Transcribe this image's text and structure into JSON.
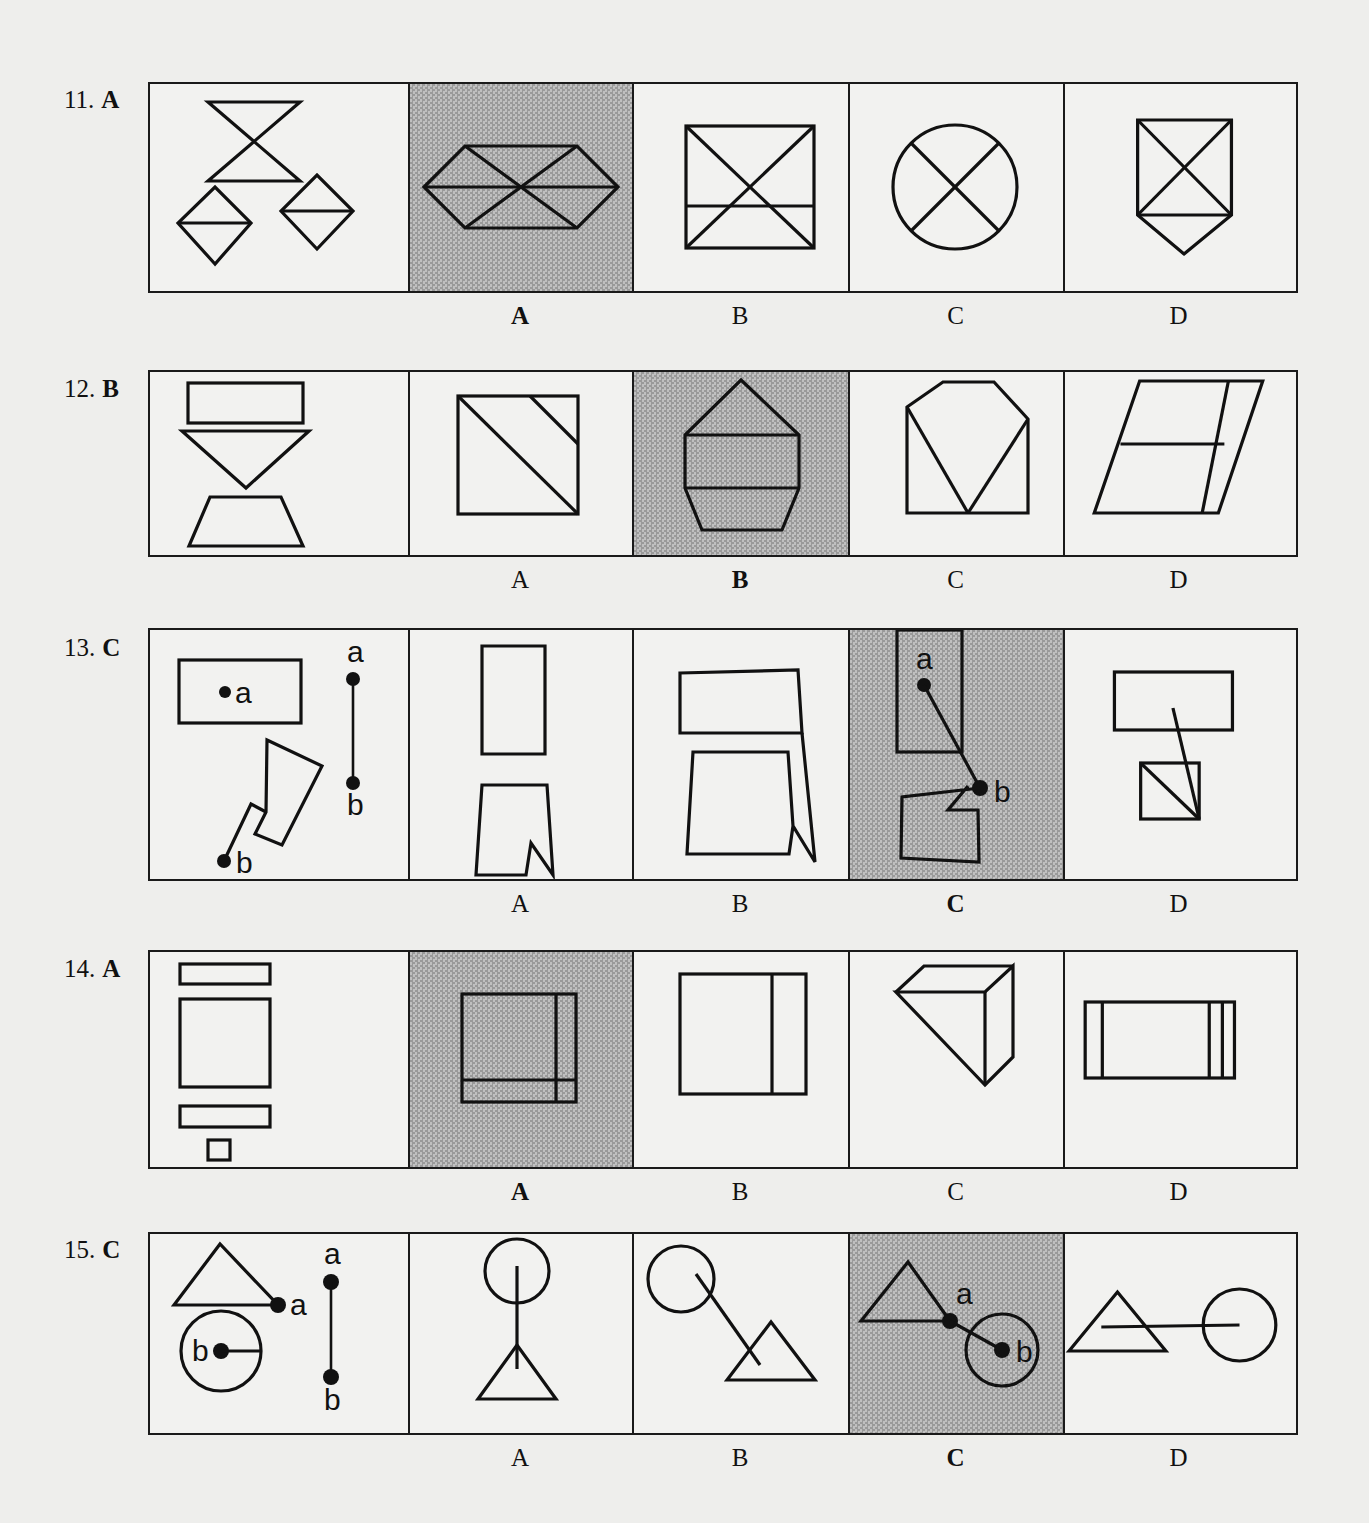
{
  "page": {
    "kind": "multiple-choice-figure-test",
    "background_color": "#eeeeec",
    "ink_color": "#111111",
    "shaded_cell_color": "#a8a8a8",
    "panel_border_color": "#1a1a1a"
  },
  "option_letters": [
    "A",
    "B",
    "C",
    "D"
  ],
  "questions": [
    {
      "number": "11.",
      "answer": "A",
      "correct_index": 0,
      "prompt_description": "bow-tie (two triangles meeting at a point), a diamond with horizontal mid-line, and a second diamond with horizontal mid-line",
      "options": [
        {
          "letter": "A",
          "shaded": true,
          "description": "elongated hexagon divided into six triangles by two diagonals and a horizontal line"
        },
        {
          "letter": "B",
          "shaded": false,
          "description": "square with both diagonals and a horizontal line across the lower third"
        },
        {
          "letter": "C",
          "shaded": false,
          "description": "circle quartered by two crossing diagonals"
        },
        {
          "letter": "D",
          "shaded": false,
          "description": "square with both diagonals plus a downward triangular point below"
        }
      ]
    },
    {
      "number": "12.",
      "answer": "B",
      "correct_index": 1,
      "prompt_description": "a horizontal rectangle, a downward-pointing triangle, and an upward trapezoid stacked vertically",
      "options": [
        {
          "letter": "A",
          "shaded": false,
          "description": "square with two parallel diagonal lines"
        },
        {
          "letter": "B",
          "shaded": true,
          "description": "house/pentagon shape with a peaked top and two horizontal bands"
        },
        {
          "letter": "C",
          "shaded": false,
          "description": "hexagon with an inscribed downward V forming an envelope shape"
        },
        {
          "letter": "D",
          "shaded": false,
          "description": "parallelogram split by a vertical line and a horizontal line"
        }
      ]
    },
    {
      "number": "13.",
      "answer": "C",
      "correct_index": 2,
      "prompt_description": "a horizontal rectangle containing point a, a tilted square notched at point b, plus a separate vertical segment from a to b",
      "prompt_point_labels": [
        "a",
        "b"
      ],
      "connector_labels": [
        "a",
        "b"
      ],
      "options": [
        {
          "letter": "A",
          "shaded": false,
          "description": "vertical rectangle above a notched quadrilateral, stacked and touching"
        },
        {
          "letter": "B",
          "shaded": false,
          "description": "horizontal rectangle with a notched quadrilateral overlapping below-right"
        },
        {
          "letter": "C",
          "shaded": true,
          "description": "vertical rectangle with point a joined by a line to point b on a notched quadrilateral below"
        },
        {
          "letter": "D",
          "shaded": false,
          "description": "horizontal rectangle with a line running down into a small square with a diagonal"
        }
      ]
    },
    {
      "number": "14.",
      "answer": "A",
      "correct_index": 0,
      "prompt_description": "thin rectangle, large square, thin rectangle, and a small square stacked vertically",
      "options": [
        {
          "letter": "A",
          "shaded": true,
          "description": "square with a vertical line near the right edge and a horizontal line near the bottom edge"
        },
        {
          "letter": "B",
          "shaded": false,
          "description": "square divided by a single vertical line right of centre"
        },
        {
          "letter": "C",
          "shaded": false,
          "description": "isometric drawing of a cube"
        },
        {
          "letter": "D",
          "shaded": false,
          "description": "wide rectangle with three vertical lines near its left and right edges"
        }
      ]
    },
    {
      "number": "15.",
      "answer": "C",
      "correct_index": 2,
      "prompt_description": "triangle with point a at its lower-right vertex, circle with point b at its centre, plus a separate vertical segment from a to b",
      "prompt_point_labels": [
        "a",
        "b"
      ],
      "connector_labels": [
        "a",
        "b"
      ],
      "options": [
        {
          "letter": "A",
          "shaded": false,
          "description": "circle above a triangle joined by a long vertical line"
        },
        {
          "letter": "B",
          "shaded": false,
          "description": "circle upper-left joined by a diagonal line to a triangle lower-right"
        },
        {
          "letter": "C",
          "shaded": true,
          "description": "triangle with point a joined by a short line to point b at the centre of a circle"
        },
        {
          "letter": "D",
          "shaded": false,
          "description": "triangle joined by a long horizontal line to a circle on the right"
        }
      ]
    }
  ]
}
